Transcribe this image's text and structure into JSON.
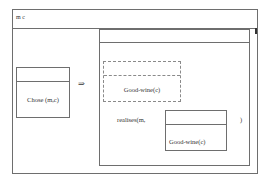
{
  "diagram": {
    "type": "discourse-representation-structure",
    "outer_box": {
      "header": "m c",
      "antecedent": {
        "header": "",
        "condition": "Chose (m,c)"
      },
      "implication_symbol": "⇒",
      "consequent": {
        "header": "",
        "inner_dashed_box": {
          "header": "",
          "condition": "Good-wine(c)"
        },
        "predicate_prefix": "realises(m,",
        "predicate_box": {
          "header": "",
          "condition": "Good-wine(c)"
        },
        "predicate_suffix": ")"
      }
    }
  }
}
